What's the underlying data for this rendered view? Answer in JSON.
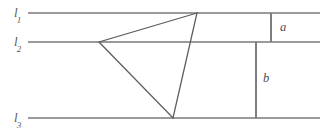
{
  "figure": {
    "type": "geometry-diagram",
    "width": 333,
    "height": 130,
    "background_color": "#ffffff",
    "parallel_line_color": "#9a9a9d",
    "triangle_color": "#5d5d61",
    "measure_line_color": "#7d7d81",
    "label_color": "#59595c",
    "parallel_lines": [
      {
        "id": "l1",
        "label": "l",
        "subscript": "1",
        "label_x": 14,
        "label_y": 6,
        "y": 13,
        "x_start": 28,
        "x_end": 320
      },
      {
        "id": "l2",
        "label": "l",
        "subscript": "2",
        "label_x": 14,
        "label_y": 35,
        "y": 42,
        "x_start": 28,
        "x_end": 320
      },
      {
        "id": "l3",
        "label": "l",
        "subscript": "3",
        "label_x": 14,
        "label_y": 111,
        "y": 118,
        "x_start": 28,
        "x_end": 320
      }
    ],
    "triangle": {
      "name": "inscribed-triangle",
      "vertices": [
        {
          "name": "apex-on-l1",
          "x": 197,
          "y": 13,
          "on_line": "l1"
        },
        {
          "name": "left-on-l2",
          "x": 99,
          "y": 42,
          "on_line": "l2"
        },
        {
          "name": "bottom-on-l3",
          "x": 173,
          "y": 118,
          "on_line": "l3"
        }
      ],
      "points_attr": "197,13 99,42 173,118"
    },
    "measure_segments": [
      {
        "id": "a",
        "label": "a",
        "x": 271,
        "y_start": 13,
        "y_end": 42,
        "between": "l1-l2",
        "label_x": 280,
        "label_y": 21
      },
      {
        "id": "b",
        "label": "b",
        "x": 256,
        "y_start": 42,
        "y_end": 118,
        "between": "l2-l3",
        "label_x": 263,
        "label_y": 72
      }
    ]
  }
}
